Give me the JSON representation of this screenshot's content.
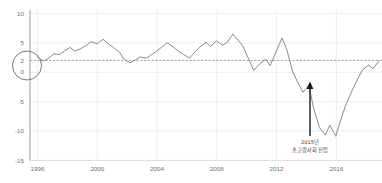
{
  "chart_data": {
    "type": "line",
    "title": "",
    "subtitle": "",
    "xlabel": "",
    "ylabel": "",
    "xlim": [
      1995.0,
      2018.6
    ],
    "ylim": [
      -15,
      10
    ],
    "grid": true,
    "legend": "none",
    "x_ticks": [
      "1996",
      "2000",
      "2004",
      "2008",
      "2012",
      "2016"
    ],
    "x_tick_values": [
      1996,
      2000,
      2004,
      2008,
      2012,
      2016
    ],
    "y_ticks": [
      "10",
      "5",
      "2",
      "0",
      "-5",
      "-10",
      "-15"
    ],
    "y_tick_values": [
      10,
      5,
      2,
      0,
      -5,
      -10,
      -15
    ],
    "highlight": {
      "value": 2,
      "label": "2",
      "marker": "circled-y-tick",
      "reference_line": "dashed",
      "reference_line_color": "#7a8a9a"
    },
    "line_color": "#8a8a8a",
    "series": [
      {
        "name": "series-1",
        "x": [
          1995.5,
          1995.9,
          1996.2,
          1996.6,
          1997.0,
          1997.3,
          1997.7,
          1998.0,
          1998.4,
          1998.8,
          1999.1,
          1999.5,
          1999.9,
          2000.2,
          2000.6,
          2001.0,
          2001.3,
          2001.7,
          2002.0,
          2002.4,
          2002.8,
          2003.1,
          2003.5,
          2003.9,
          2004.2,
          2004.6,
          2005.0,
          2005.3,
          2005.7,
          2006.0,
          2006.4,
          2006.8,
          2007.1,
          2007.5,
          2007.9,
          2008.2,
          2008.6,
          2009.0,
          2009.3,
          2009.7,
          2010.0,
          2010.4,
          2010.8,
          2011.1,
          2011.5,
          2011.9,
          2012.2,
          2012.6,
          2013.0,
          2013.3,
          2013.7,
          2014.0,
          2014.4,
          2014.8,
          2015.1,
          2015.5,
          2015.9,
          2016.2,
          2016.6,
          2017.0,
          2017.3,
          2017.7,
          2018.0,
          2018.4
        ],
        "y": [
          2.6,
          1.9,
          2.3,
          3.1,
          3.0,
          3.6,
          4.2,
          3.6,
          4.0,
          4.6,
          5.2,
          4.8,
          5.6,
          4.9,
          4.2,
          3.4,
          2.2,
          1.6,
          2.0,
          2.6,
          2.4,
          2.9,
          3.6,
          4.4,
          5.0,
          4.3,
          3.5,
          3.0,
          2.4,
          3.3,
          4.3,
          5.1,
          4.4,
          5.3,
          4.6,
          5.0,
          6.5,
          5.3,
          4.3,
          2.0,
          0.3,
          1.4,
          2.2,
          1.1,
          3.5,
          5.8,
          4.0,
          0.2,
          -2.0,
          -3.4,
          -2.2,
          -6.0,
          -9.4,
          -10.7,
          -9.0,
          -10.9,
          -7.6,
          -5.4,
          -3.1,
          -1.0,
          0.4,
          1.2,
          0.6,
          1.9
        ],
        "values_note": "monthly-like series, approximate read-off"
      }
    ],
    "annotations": [
      {
        "name": "super-aged-society-entry",
        "line1": "2015년",
        "line2": "초고령사회 진입",
        "x_value": 2015.1,
        "arrow": "up"
      }
    ]
  }
}
